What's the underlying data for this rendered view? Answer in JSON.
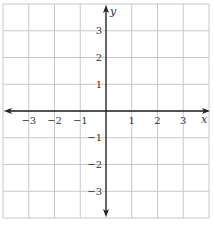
{
  "chart_data": {
    "type": "scatter",
    "title": "",
    "xlabel": "x",
    "ylabel": "y",
    "xlim": [
      -4,
      4
    ],
    "ylim": [
      -4,
      4
    ],
    "grid": true,
    "x_ticks": [
      -3,
      -2,
      -1,
      1,
      2,
      3
    ],
    "y_ticks": [
      -3,
      -2,
      -1,
      1,
      2,
      3
    ],
    "x_tick_labels": [
      "−3",
      "−2",
      "−1",
      "1",
      "2",
      "3"
    ],
    "y_tick_labels": [
      "−3",
      "−2",
      "−1",
      "1",
      "2",
      "3"
    ],
    "series": [],
    "legend": null
  },
  "colors": {
    "grid": "#c8c8c8",
    "axis": "#222222",
    "text": "#333333"
  }
}
